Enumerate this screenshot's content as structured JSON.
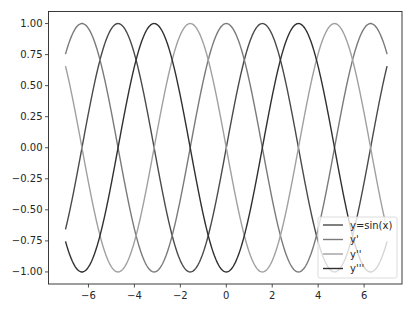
{
  "chart_data": {
    "type": "line",
    "title": "",
    "xlabel": "",
    "ylabel": "",
    "xlim": [
      -7.74,
      7.65
    ],
    "ylim": [
      -1.097,
      1.097
    ],
    "grid": false,
    "legend_position": "lower right",
    "x_domain": [
      -7,
      7
    ],
    "x_ticks": [
      -6,
      -4,
      -2,
      0,
      2,
      4,
      6
    ],
    "x_tick_labels": [
      "−6",
      "−4",
      "−2",
      "0",
      "2",
      "4",
      "6"
    ],
    "y_ticks": [
      1.0,
      0.75,
      0.5,
      0.25,
      0.0,
      -0.25,
      -0.5,
      -0.75,
      -1.0
    ],
    "y_tick_labels": [
      "1.00",
      "0.75",
      "0.50",
      "0.25",
      "0.00",
      "−0.25",
      "−0.50",
      "−0.75",
      "−1.00"
    ],
    "series": [
      {
        "name": "y=sin(x)",
        "function": "sin(x)",
        "color": "#4a4a4a",
        "x": [
          -7,
          -6,
          -5,
          -4,
          -3,
          -2,
          -1,
          0,
          1,
          2,
          3,
          4,
          5,
          6,
          7
        ],
        "values": [
          -0.657,
          0.279,
          0.959,
          0.757,
          -0.141,
          -0.909,
          -0.841,
          0.0,
          0.841,
          0.909,
          0.141,
          -0.757,
          -0.959,
          -0.279,
          0.657
        ]
      },
      {
        "name": "y'",
        "function": "cos(x)",
        "color": "#7a7a7a",
        "x": [
          -7,
          -6,
          -5,
          -4,
          -3,
          -2,
          -1,
          0,
          1,
          2,
          3,
          4,
          5,
          6,
          7
        ],
        "values": [
          0.754,
          0.96,
          0.284,
          -0.654,
          -0.99,
          -0.416,
          0.54,
          1.0,
          0.54,
          -0.416,
          -0.99,
          -0.654,
          0.284,
          0.96,
          0.754
        ]
      },
      {
        "name": "y''",
        "function": "-sin(x)",
        "color": "#a0a0a0",
        "x": [
          -7,
          -6,
          -5,
          -4,
          -3,
          -2,
          -1,
          0,
          1,
          2,
          3,
          4,
          5,
          6,
          7
        ],
        "values": [
          0.657,
          -0.279,
          -0.959,
          -0.757,
          0.141,
          0.909,
          0.841,
          0.0,
          -0.841,
          -0.909,
          -0.141,
          0.757,
          0.959,
          0.279,
          -0.657
        ]
      },
      {
        "name": "y'''",
        "function": "-cos(x)",
        "color": "#303030",
        "x": [
          -7,
          -6,
          -5,
          -4,
          -3,
          -2,
          -1,
          0,
          1,
          2,
          3,
          4,
          5,
          6,
          7
        ],
        "values": [
          -0.754,
          -0.96,
          -0.284,
          0.654,
          0.99,
          0.416,
          -0.54,
          -1.0,
          -0.54,
          0.416,
          0.99,
          0.654,
          -0.284,
          -0.96,
          -0.754
        ]
      }
    ]
  }
}
